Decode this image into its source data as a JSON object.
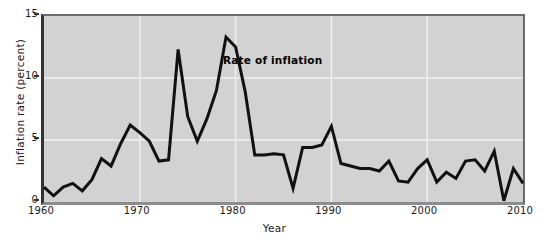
{
  "chart_data": {
    "type": "line",
    "title": "",
    "xlabel": "Year",
    "ylabel": "Inflation rate (percent)",
    "xlim": [
      1960,
      2010
    ],
    "ylim": [
      0,
      15
    ],
    "grid": true,
    "legend_position": "inline-annotation",
    "annotations": [
      {
        "text": "Rate of inflation",
        "x": 1979,
        "y": 11.2
      }
    ],
    "x_ticks": [
      1960,
      1970,
      1980,
      1990,
      2000,
      2010
    ],
    "x_tick_labels": [
      "1960",
      "1970",
      "1980",
      "1990",
      "2000",
      "2010"
    ],
    "y_ticks": [
      0,
      5,
      10,
      15
    ],
    "y_tick_labels": [
      "0",
      "5",
      "10",
      "15"
    ],
    "series": [
      {
        "name": "Rate of inflation",
        "color": "#111111",
        "x": [
          1960,
          1961,
          1962,
          1963,
          1964,
          1965,
          1966,
          1967,
          1968,
          1969,
          1970,
          1971,
          1972,
          1973,
          1974,
          1975,
          1976,
          1977,
          1978,
          1979,
          1980,
          1981,
          1982,
          1983,
          1984,
          1985,
          1986,
          1987,
          1988,
          1989,
          1990,
          1991,
          1992,
          1993,
          1994,
          1995,
          1996,
          1997,
          1998,
          1999,
          2000,
          2001,
          2002,
          2003,
          2004,
          2005,
          2006,
          2007,
          2008,
          2009,
          2010
        ],
        "values": [
          1.2,
          0.5,
          1.2,
          1.5,
          0.9,
          1.8,
          3.5,
          2.9,
          4.7,
          6.2,
          5.6,
          4.9,
          3.3,
          3.4,
          12.3,
          6.9,
          4.9,
          6.7,
          9.0,
          13.3,
          12.5,
          8.9,
          3.8,
          3.8,
          3.9,
          3.8,
          1.1,
          4.4,
          4.4,
          4.6,
          6.1,
          3.1,
          2.9,
          2.7,
          2.7,
          2.5,
          3.3,
          1.7,
          1.6,
          2.7,
          3.4,
          1.6,
          2.4,
          1.9,
          3.3,
          3.4,
          2.5,
          4.1,
          0.1,
          2.7,
          1.5
        ]
      }
    ]
  },
  "axes": {
    "y_title": "Inflation rate (percent)",
    "x_title": "Year"
  },
  "colors": {
    "plot_background": "#d2d2d2",
    "gridline": "#f0f0f0",
    "line": "#111111",
    "axis": "#333333",
    "text": "#1a1a1a"
  }
}
